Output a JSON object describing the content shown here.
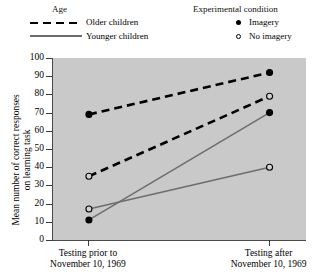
{
  "legend": {
    "age": {
      "title": "Age",
      "items": [
        {
          "label": "Older children",
          "style": "dashed"
        },
        {
          "label": "Younger children",
          "style": "solid"
        }
      ]
    },
    "condition": {
      "title": "Experimental condition",
      "items": [
        {
          "label": "Imagery",
          "marker": "filled-circle"
        },
        {
          "label": "No imagery",
          "marker": "open-circle"
        }
      ]
    }
  },
  "chart_data": {
    "type": "line",
    "title": "",
    "xlabel": "",
    "ylabel": "Mean number of correct responses on learning task",
    "ylabel_line1": "Mean number of correct responses",
    "ylabel_line2": "on learning task",
    "categories": [
      "Testing prior to November 10, 1969",
      "Testing after November 10, 1969"
    ],
    "category_lines": [
      [
        "Testing prior to",
        "November 10, 1969"
      ],
      [
        "Testing after",
        "November 10, 1969"
      ]
    ],
    "ylim": [
      0,
      100
    ],
    "yticks": [
      0,
      10,
      20,
      30,
      40,
      50,
      60,
      70,
      80,
      90,
      100
    ],
    "grid": false,
    "legend_position": "top",
    "series": [
      {
        "name": "Older children — Imagery",
        "age": "Older children",
        "condition": "Imagery",
        "line_style": "dashed",
        "marker": "filled-circle",
        "color": "#000000",
        "values": [
          69,
          92
        ]
      },
      {
        "name": "Older children — No imagery",
        "age": "Older children",
        "condition": "No imagery",
        "line_style": "dashed",
        "marker": "open-circle",
        "color": "#000000",
        "values": [
          35,
          79
        ]
      },
      {
        "name": "Younger children — Imagery",
        "age": "Younger children",
        "condition": "Imagery",
        "line_style": "solid",
        "marker": "filled-circle",
        "color": "#6d6d6d",
        "values": [
          11,
          70
        ]
      },
      {
        "name": "Younger children — No imagery",
        "age": "Younger children",
        "condition": "No imagery",
        "line_style": "solid",
        "marker": "open-circle",
        "color": "#6d6d6d",
        "values": [
          17,
          40
        ]
      }
    ]
  }
}
